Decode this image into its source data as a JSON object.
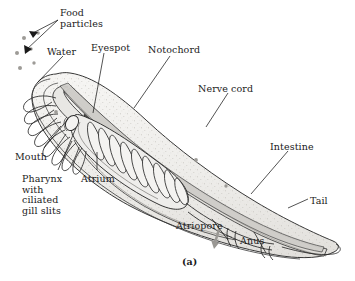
{
  "figure": {
    "caption": "(a)",
    "organism": "lancelet",
    "background_color": "#ffffff",
    "ink_color": "#1a1a1a",
    "body_fill_color": "#f1f0ee",
    "shade_color": "#cfcdc9",
    "cord_color": "#8f8d89"
  },
  "labels": [
    {
      "id": "food-particles",
      "text": "Food\nparticles",
      "x": 60,
      "y": 8,
      "anchor": "start"
    },
    {
      "id": "water",
      "text": "Water",
      "x": 47,
      "y": 47,
      "anchor": "start"
    },
    {
      "id": "eyespot",
      "text": "Eyespot",
      "x": 91,
      "y": 43,
      "anchor": "start"
    },
    {
      "id": "notochord",
      "text": "Notochord",
      "x": 148,
      "y": 45,
      "anchor": "start"
    },
    {
      "id": "nerve-cord",
      "text": "Nerve cord",
      "x": 198,
      "y": 84,
      "anchor": "start"
    },
    {
      "id": "intestine",
      "text": "Intestine",
      "x": 270,
      "y": 142,
      "anchor": "start"
    },
    {
      "id": "tail",
      "text": "Tail",
      "x": 310,
      "y": 196,
      "anchor": "start"
    },
    {
      "id": "anus",
      "text": "Anus",
      "x": 240,
      "y": 236,
      "anchor": "start"
    },
    {
      "id": "atriopore",
      "text": "Atriopore",
      "x": 176,
      "y": 221,
      "anchor": "start"
    },
    {
      "id": "atrium",
      "text": "Atrium",
      "x": 81,
      "y": 174,
      "anchor": "start"
    },
    {
      "id": "pharynx",
      "text": "Pharynx\nwith\nciliated\ngill slits",
      "x": 22,
      "y": 174,
      "anchor": "start"
    },
    {
      "id": "mouth",
      "text": "Mouth",
      "x": 15,
      "y": 152,
      "anchor": "start"
    }
  ],
  "anatomy": {
    "food_particle_count": 6,
    "gill_bar_count": 9,
    "oral_cirri_count": 8,
    "structures": [
      "food particles",
      "water current",
      "eyespot",
      "notochord",
      "nerve cord",
      "intestine",
      "tail",
      "anus",
      "atriopore",
      "atrium",
      "pharynx with ciliated gill slits",
      "mouth",
      "oral cirri",
      "dorsal fin",
      "cerebral vesicle"
    ]
  }
}
